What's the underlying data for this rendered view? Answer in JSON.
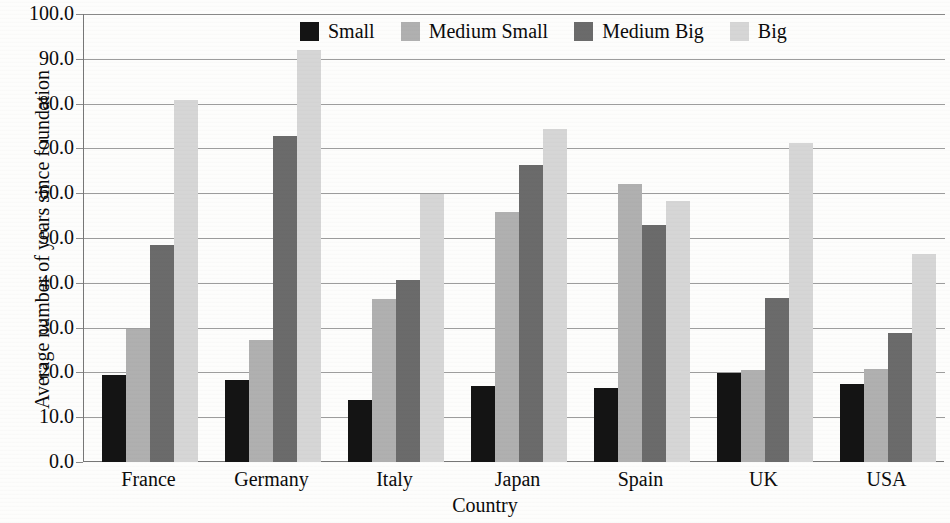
{
  "chart_data": {
    "type": "bar",
    "title": "",
    "xlabel": "Country",
    "ylabel": "Average number of years since foundation",
    "categories": [
      "France",
      "Germany",
      "Italy",
      "Japan",
      "Spain",
      "UK",
      "USA"
    ],
    "series": [
      {
        "name": "Small",
        "color": "#141414",
        "values": [
          19.5,
          18.4,
          13.9,
          16.9,
          16.6,
          19.8,
          17.5
        ]
      },
      {
        "name": "Medium Small",
        "color": "#b0b0b0",
        "values": [
          29.6,
          27.3,
          36.3,
          55.7,
          62.0,
          20.6,
          20.7
        ]
      },
      {
        "name": "Medium Big",
        "color": "#6b6b6b",
        "values": [
          48.5,
          72.7,
          40.7,
          66.3,
          53.0,
          36.7,
          28.8
        ]
      },
      {
        "name": "Big",
        "color": "#d6d6d6",
        "values": [
          80.8,
          92.0,
          59.9,
          74.3,
          58.3,
          71.3,
          46.5
        ]
      }
    ],
    "ylim": [
      0,
      100
    ],
    "ytick_step": 10,
    "ytick_labels": [
      "0.0",
      "10.0",
      "20.0",
      "30.0",
      "40.0",
      "50.0",
      "60.0",
      "70.0",
      "80.0",
      "90.0",
      "100.0"
    ],
    "grid": true,
    "grid_axis": "y",
    "legend_position": "top-center-inside",
    "legend_entries": [
      "Small",
      "Medium Small",
      "Medium Big",
      "Big"
    ]
  }
}
